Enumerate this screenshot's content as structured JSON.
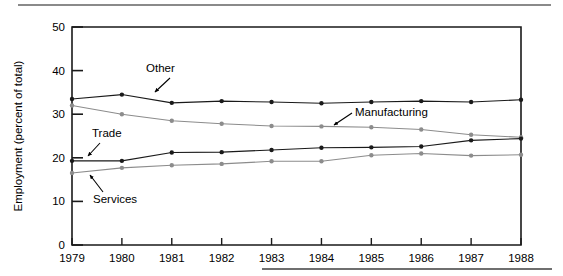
{
  "figure": {
    "plot_frame_color": "#1a1a1a",
    "background": "#ffffff",
    "top_rule_color": "#8a8a8a",
    "bottom_rule_color": "#6f6f6f"
  },
  "chart_data": {
    "type": "line",
    "title": "",
    "subtitle": "",
    "xlabel": "",
    "ylabel": "Employment (percent of total)",
    "x": [
      1979,
      1980,
      1981,
      1982,
      1983,
      1984,
      1985,
      1986,
      1987,
      1988
    ],
    "xtick_labels": [
      "1979",
      "1980",
      "1981",
      "1982",
      "1983",
      "1984",
      "1985",
      "1986",
      "1987",
      "1988"
    ],
    "ytick_labels": [
      "0",
      "10",
      "20",
      "30",
      "40",
      "50"
    ],
    "yticks": [
      0,
      10,
      20,
      30,
      40,
      50
    ],
    "ylim": [
      0,
      50
    ],
    "xlim": [
      1979,
      1988
    ],
    "grid": false,
    "legend_position": "inline-annotations",
    "series": [
      {
        "name": "Other",
        "color": "#1a1a1a",
        "marker": "filled-circle",
        "values": [
          33.5,
          34.5,
          32.6,
          33.0,
          32.8,
          32.5,
          32.8,
          33.0,
          32.8,
          33.3
        ]
      },
      {
        "name": "Manufacturing",
        "color": "#8c8c8c",
        "marker": "filled-circle",
        "values": [
          32.0,
          30.0,
          28.5,
          27.8,
          27.3,
          27.2,
          27.0,
          26.5,
          25.3,
          24.7
        ]
      },
      {
        "name": "Trade",
        "color": "#1a1a1a",
        "marker": "filled-circle",
        "values": [
          19.3,
          19.3,
          21.2,
          21.3,
          21.8,
          22.3,
          22.4,
          22.6,
          24.0,
          24.4
        ]
      },
      {
        "name": "Services",
        "color": "#8c8c8c",
        "marker": "filled-circle",
        "values": [
          16.5,
          17.7,
          18.3,
          18.6,
          19.2,
          19.2,
          20.6,
          21.0,
          20.5,
          20.7
        ]
      }
    ],
    "annotations": [
      {
        "text": "Other",
        "label_x": 146,
        "label_y": 72,
        "arrow_from_x": 170,
        "arrow_from_y": 78,
        "arrow_to_x": 155,
        "arrow_to_y": 92
      },
      {
        "text": "Manufacturing",
        "label_x": 355,
        "label_y": 116,
        "arrow_from_x": 352,
        "arrow_from_y": 113,
        "arrow_to_x": 334,
        "arrow_to_y": 125
      },
      {
        "text": "Trade",
        "label_x": 92,
        "label_y": 137,
        "arrow_from_x": 100,
        "arrow_from_y": 143,
        "arrow_to_x": 88,
        "arrow_to_y": 156
      },
      {
        "text": "Services",
        "label_x": 93,
        "label_y": 203,
        "arrow_from_x": 103,
        "arrow_from_y": 192,
        "arrow_to_x": 90,
        "arrow_to_y": 175
      }
    ]
  }
}
